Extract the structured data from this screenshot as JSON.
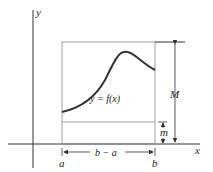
{
  "diagram": {
    "labels": {
      "y_axis": "y",
      "x_axis": "x",
      "curve": "y = f(x)",
      "upper_bound": "M",
      "lower_bound": "m",
      "width": "b − a",
      "left_endpoint": "a",
      "right_endpoint": "b"
    },
    "colors": {
      "axis": "#333333",
      "curve": "#333333",
      "box": "#888888"
    }
  }
}
